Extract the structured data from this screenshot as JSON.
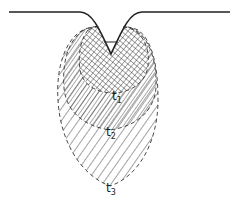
{
  "diagram": {
    "type": "cross-section of expanding zone beneath a surface notch",
    "surface": {
      "description": "horizontal surface with V-shaped notch / indentation"
    },
    "zones": [
      {
        "id": "t1",
        "label_base": "t",
        "label_sub": "1",
        "fill": "crosshatch",
        "boundary": "dashed"
      },
      {
        "id": "t2",
        "label_base": "t",
        "label_sub": "2",
        "fill": "dense diagonal hatch",
        "boundary": "dashed"
      },
      {
        "id": "t3",
        "label_base": "t",
        "label_sub": "3",
        "fill": "sparse diagonal hatch",
        "boundary": "dashed"
      }
    ],
    "colors": {
      "line": "#222222",
      "background": "#ffffff"
    }
  }
}
